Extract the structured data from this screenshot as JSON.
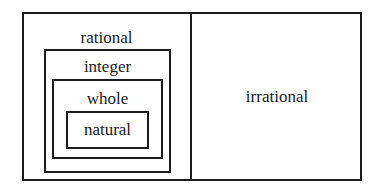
{
  "diagram": {
    "type": "nested-set-diagram",
    "title": "",
    "sets": {
      "rational": {
        "label": "rational",
        "contains": [
          "integer"
        ]
      },
      "integer": {
        "label": "integer",
        "contains": [
          "whole"
        ]
      },
      "whole": {
        "label": "whole",
        "contains": [
          "natural"
        ]
      },
      "natural": {
        "label": "natural",
        "contains": []
      },
      "irrational": {
        "label": "irrational",
        "contains": []
      }
    },
    "line_color": "#1a1a1a",
    "text_color": "#1a1a1a",
    "background": "#ffffff"
  }
}
